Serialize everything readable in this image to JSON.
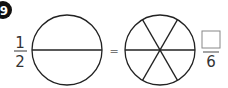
{
  "problem": {
    "number_badge": "9",
    "left_fraction": {
      "numerator": "1",
      "denominator": "2"
    },
    "equals_sign": "=",
    "right_fraction": {
      "numerator_box": "",
      "denominator": "6"
    },
    "left_circle": {
      "parts": 2
    },
    "right_circle": {
      "parts": 6
    }
  },
  "colors": {
    "stroke": "#222222",
    "badge": "#111111",
    "text": "#333333",
    "box": "#888888"
  }
}
